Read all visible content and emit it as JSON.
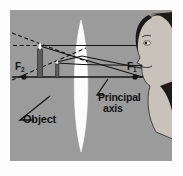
{
  "figure": {
    "panel_background": "#9b9b9b",
    "page_background": "#fdfdfd",
    "ink_color": "#141414",
    "lens_color": "#fcfcfc"
  },
  "labels": {
    "focal_left": "F",
    "focal_left_sub": "2",
    "focal_right": "F",
    "focal_right_sub": "1",
    "object": "Object",
    "principal": "Principal",
    "axis": "axis"
  },
  "optics": {
    "principal_axis_y": 77,
    "lens_center_x": 81,
    "focal_left_x": 24,
    "focal_right_x": 135,
    "object_x": 57,
    "image_x": 40,
    "lens_top_y": 20,
    "lens_bottom_y": 152
  },
  "elements": {
    "lens_name": "biconvex-lens",
    "eye_name": "observer-face",
    "object_name": "object-candle",
    "image_name": "virtual-image-candle",
    "solid_ray_name": "refracted-ray",
    "dashed_ray_name": "virtual-ray-extension"
  }
}
